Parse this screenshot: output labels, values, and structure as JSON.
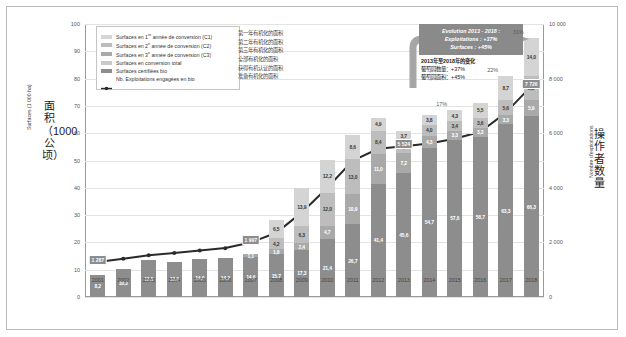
{
  "chart_data": {
    "type": "bar",
    "title": "",
    "subtitle": "",
    "xlabel": "",
    "ylabel": "Surfaces (1 000 ha)",
    "ylabel_cn": "面积（1000公顷）",
    "y2label": "Nombre d'exploitations",
    "y2label_cn": "操作者数量",
    "ylim": [
      0,
      100
    ],
    "y2lim": [
      0,
      10000
    ],
    "yticks": [
      "0",
      "10",
      "20",
      "30",
      "40",
      "50",
      "60",
      "70",
      "80",
      "90",
      "100"
    ],
    "y2ticks": [
      "0",
      "2 000",
      "4 000",
      "6 000",
      "8 000",
      "10 000"
    ],
    "grid": true,
    "legend_position": "top-left",
    "categories": [
      "2001",
      "2002",
      "2003",
      "2004",
      "2005",
      "2006",
      "2007",
      "2008",
      "2009",
      "2010",
      "2011",
      "2012",
      "2013",
      "2014",
      "2015",
      "2016",
      "2017",
      "2018"
    ],
    "series": [
      {
        "name": "Surfaces certifiées bio",
        "key": "cert",
        "color": "#8d8d8d",
        "values": [
          8.2,
          10.2,
          13.5,
          13.0,
          14.0,
          14.2,
          14.6,
          15.7,
          17.3,
          21.4,
          26.7,
          41.4,
          45.6,
          54.7,
          57.6,
          58.7,
          63.3,
          66.3
        ],
        "labels": [
          "8,2",
          "10,2",
          "13,5",
          "13,0",
          "14,0",
          "14,2",
          "14,6",
          "15,7",
          "17,3",
          "21,4",
          "26,7",
          "41,4",
          "45,6",
          "54,7",
          "57,6",
          "58,7",
          "63,3",
          "66,3"
        ]
      },
      {
        "name": "Surfaces en 3e année de conversion (C3)",
        "key": "c3",
        "color": "#a9a9a9",
        "values": [
          0,
          0,
          0,
          0,
          0,
          0,
          1.1,
          1.8,
          2.4,
          4.7,
          10.9,
          11.0,
          7.2,
          4.3,
          3.3,
          3.3,
          3.3,
          5.9
        ],
        "labels": [
          "",
          "",
          "",
          "",
          "",
          "",
          "1,1",
          "1,8",
          "2,4",
          "4,7",
          "10,9",
          "11,0",
          "7,2",
          "4,3",
          "3,3",
          "3,3",
          "3,3",
          "5,9"
        ]
      },
      {
        "name": "Surfaces en 2e année de conversion (C2)",
        "key": "c2",
        "color": "#bdbdbd",
        "values": [
          0,
          0,
          0,
          0,
          0,
          0,
          0,
          4.2,
          6.3,
          12.0,
          13.0,
          8.4,
          4.4,
          4.0,
          3.4,
          3.6,
          5.6,
          8.8
        ],
        "labels": [
          "",
          "",
          "",
          "",
          "",
          "",
          "",
          "4,2",
          "6,3",
          "12,0",
          "13,0",
          "8,4",
          "4,4",
          "4,0",
          "3,4",
          "3,6",
          "5,6",
          "8,8"
        ]
      },
      {
        "name": "Surfaces en 1re année de conversion (C1)",
        "key": "c1",
        "color": "#d4d4d4",
        "values": [
          0,
          0,
          0,
          0,
          0,
          0,
          0,
          6.5,
          13.9,
          12.2,
          8.6,
          4.9,
          3.7,
          3.8,
          4.3,
          5.5,
          8.7,
          14.0
        ],
        "labels": [
          "",
          "",
          "",
          "",
          "",
          "",
          "",
          "6,5",
          "13,9",
          "12,2",
          "8,6",
          "4,9",
          "3,7",
          "3,8",
          "4,3",
          "5,5",
          "8,7",
          "14,0"
        ]
      }
    ],
    "line_series": {
      "name": "Nb. Exploitations engagées en bio",
      "color": "#2a2a2a",
      "axis": "right",
      "values": [
        1287,
        1400,
        1530,
        1610,
        1700,
        1790,
        1997,
        2350,
        3100,
        4000,
        5000,
        5430,
        5524,
        5620,
        5800,
        6050,
        6750,
        7726
      ],
      "point_labels": [
        {
          "index": 0,
          "text": "1 287"
        },
        {
          "index": 6,
          "text": "1 997"
        },
        {
          "index": 12,
          "text": "5 524"
        },
        {
          "index": 17,
          "text": "7 726"
        }
      ]
    },
    "annotations": [
      {
        "text": "22%",
        "x_index": 16,
        "value": 22
      },
      {
        "text": "31%",
        "x_index": 17,
        "value": 31
      },
      {
        "text": "17%",
        "x_index": 14,
        "value": 17
      }
    ]
  },
  "legend": {
    "items": [
      {
        "label_pre": "Surfaces en 1",
        "sup": "re",
        "label_post": " année de conversion (C1)",
        "swatch": "#d4d4d4",
        "icon": "swatch-icon"
      },
      {
        "label_pre": "Surfaces en 2",
        "sup": "e",
        "label_post": " année de conversion (C2)",
        "swatch": "#bdbdbd",
        "icon": "swatch-icon"
      },
      {
        "label_pre": "Surfaces en 3",
        "sup": "e",
        "label_post": " année de conversion (C3)",
        "swatch": "#a9a9a9",
        "icon": "swatch-icon"
      },
      {
        "label_pre": "Surfaces en conversion total",
        "sup": "",
        "label_post": "",
        "swatch": "#c9c9c9",
        "icon": "swatch-icon"
      },
      {
        "label_pre": "Surfaces certifiées bio",
        "sup": "",
        "label_post": "",
        "swatch": "#8d8d8d",
        "icon": "swatch-icon"
      },
      {
        "label_pre": "Nb. Exploitations engagées en bio",
        "sup": "",
        "label_post": "",
        "swatch": "#2a2a2a",
        "icon": "line-marker-icon"
      }
    ],
    "chinese": [
      "第一年有机化的面积",
      "第二年有机化的面积",
      "第三年有机化的面积",
      "全部有机化的面积",
      "获得有机认证的面积",
      "准备有机化的面积"
    ]
  },
  "callout": {
    "line1": "Evolution 2013 - 2018 :",
    "line2": "Exploitations : +37%",
    "line3": "Surfaces : +45%",
    "cn_title": "2013年至2018年的变化",
    "cn_line1": "葡萄园数量：+37%",
    "cn_line2": "葡萄园面积：+45%"
  }
}
